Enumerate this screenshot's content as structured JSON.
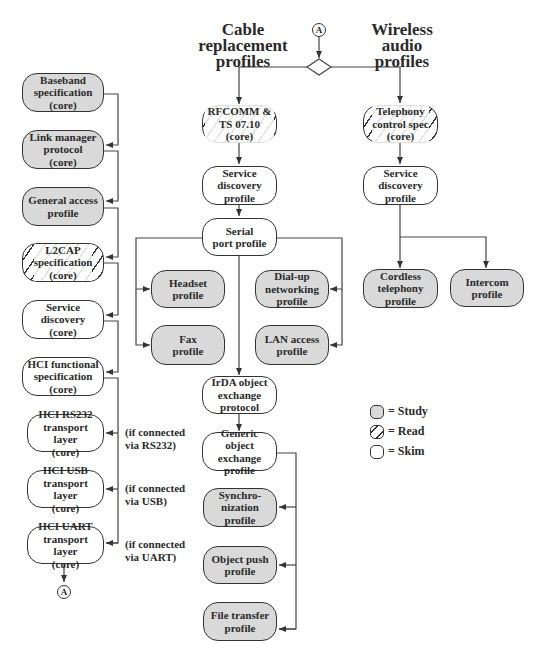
{
  "headings": {
    "cable": "Cable\nreplacement\nprofiles",
    "wireless": "Wireless\naudio\nprofiles"
  },
  "connector_label": "A",
  "core_stack": [
    {
      "label": "Baseband\nspecification\n(core)",
      "style": "study"
    },
    {
      "label": "Link manager\nprotocol\n(core)",
      "style": "study"
    },
    {
      "label": "General access\nprofile",
      "style": "study"
    },
    {
      "label": "L2CAP\nspecification\n(core)",
      "style": "read"
    },
    {
      "label": "Service\ndiscovery\n(core)",
      "style": "skim"
    },
    {
      "label": "HCI functional\nspecification\n(core)",
      "style": "skim"
    },
    {
      "label": "HCI RS232\ntransport layer\n(core)",
      "style": "skim"
    },
    {
      "label": "HCI USB\ntransport layer\n(core)",
      "style": "skim"
    },
    {
      "label": "HCI UART\ntransport layer\n(core)",
      "style": "skim"
    }
  ],
  "transport_notes": [
    "(if connected\nvia RS232)",
    "(if connected\nvia USB)",
    "(if connected\nvia UART)"
  ],
  "cable_profiles": {
    "rfcomm": {
      "label": "RFCOMM &\nTS 07.10 (core)",
      "style": "read"
    },
    "service_discovery": {
      "label": "Service\ndiscovery\nprofile",
      "style": "skim"
    },
    "serial_port": {
      "label": "Serial\nport profile",
      "style": "skim"
    },
    "headset": {
      "label": "Headset\nprofile",
      "style": "study"
    },
    "fax": {
      "label": "Fax\nprofile",
      "style": "study"
    },
    "dialup": {
      "label": "Dial-up\nnetworking\nprofile",
      "style": "study"
    },
    "lan": {
      "label": "LAN access\nprofile",
      "style": "study"
    },
    "irda": {
      "label": "IrDA object\nexchange\nprotocol",
      "style": "skim"
    },
    "generic_obex": {
      "label": "Generic\nobject exchange\nprofile",
      "style": "skim"
    },
    "sync": {
      "label": "Synchro-\nnization\nprofile",
      "style": "study"
    },
    "object_push": {
      "label": "Object push\nprofile",
      "style": "study"
    },
    "file_transfer": {
      "label": "File transfer\nprofile",
      "style": "study"
    }
  },
  "wireless_profiles": {
    "telephony": {
      "label": "Telephony\ncontrol spec\n(core)",
      "style": "read"
    },
    "service_discovery": {
      "label": "Service\ndiscovery\nprofile",
      "style": "skim"
    },
    "cordless": {
      "label": "Cordless\ntelephony\nprofile",
      "style": "study"
    },
    "intercom": {
      "label": "Intercom\nprofile",
      "style": "study"
    }
  },
  "legend": [
    {
      "style": "study",
      "label": "= Study"
    },
    {
      "style": "read",
      "label": "= Read"
    },
    {
      "style": "skim",
      "label": "= Skim"
    }
  ],
  "colors": {
    "study_fill": "#d9d9d9",
    "skim_fill": "#ffffff",
    "stroke": "#333333"
  }
}
